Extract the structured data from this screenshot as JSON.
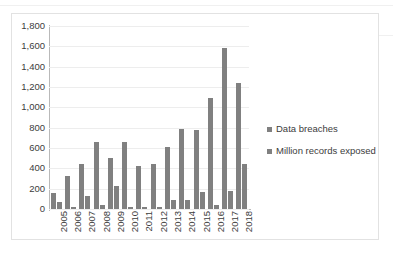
{
  "chart_data": {
    "type": "bar",
    "title": "",
    "subtitle": "",
    "xlabel": "",
    "ylabel": "",
    "grid": true,
    "legend_position": "right",
    "ylim": [
      0,
      1800
    ],
    "ytick_step": 200,
    "yticks": [
      "0",
      "200",
      "400",
      "600",
      "800",
      "1,000",
      "1,200",
      "1,400",
      "1,600",
      "1,800"
    ],
    "ytick_values": [
      0,
      200,
      400,
      600,
      800,
      1000,
      1200,
      1400,
      1600,
      1800
    ],
    "categories": [
      "2005",
      "2006",
      "2007",
      "2008",
      "2009",
      "2010",
      "2011",
      "2012",
      "2013",
      "2014",
      "2015",
      "2016",
      "2017",
      "2018"
    ],
    "series": [
      {
        "name": "Data breaches",
        "color": "#808080",
        "values": [
          157,
          321,
          446,
          656,
          498,
          662,
          419,
          447,
          614,
          783,
          781,
          1093,
          1579,
          1244
        ]
      },
      {
        "name": "Million records exposed",
        "color": "#808080",
        "values": [
          67,
          20,
          128,
          36,
          223,
          16,
          22,
          17,
          92,
          86,
          169,
          37,
          179,
          447
        ]
      }
    ]
  },
  "legend": {
    "items": [
      {
        "label": "Data breaches",
        "color": "#808080"
      },
      {
        "label": "Million records exposed",
        "color": "#808080"
      }
    ]
  },
  "colors": {
    "bar": "#808080",
    "gridline": "#ededed",
    "axis": "#b9b9b9",
    "frame": "#e2e2e2",
    "text": "#3c3c3c",
    "background": "#ffffff"
  }
}
